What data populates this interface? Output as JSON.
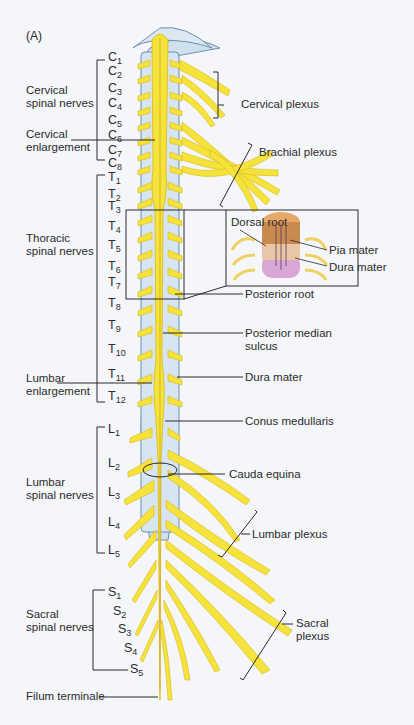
{
  "panel_label": "(A)",
  "colors": {
    "nerve": "#f5e23a",
    "nerve_dark": "#d9b81c",
    "dura": "#cfe0ee",
    "dura_edge": "#6f8fae",
    "line": "#2b2b2b",
    "background": "#f4f6f9",
    "pia": "#d9a26b",
    "dura_inset": "#d9a6d6"
  },
  "segments": {
    "cervical": [
      {
        "letter": "C",
        "num": "1",
        "y": 58
      },
      {
        "letter": "C",
        "num": "2",
        "y": 72
      },
      {
        "letter": "C",
        "num": "3",
        "y": 89
      },
      {
        "letter": "C",
        "num": "4",
        "y": 104
      },
      {
        "letter": "C",
        "num": "5",
        "y": 121
      },
      {
        "letter": "C",
        "num": "6",
        "y": 136
      },
      {
        "letter": "C",
        "num": "7",
        "y": 151
      },
      {
        "letter": "C",
        "num": "8",
        "y": 164
      }
    ],
    "thoracic": [
      {
        "letter": "T",
        "num": "1",
        "y": 178
      },
      {
        "letter": "T",
        "num": "2",
        "y": 195
      },
      {
        "letter": "T",
        "num": "3",
        "y": 207
      },
      {
        "letter": "T",
        "num": "4",
        "y": 227
      },
      {
        "letter": "T",
        "num": "5",
        "y": 246
      },
      {
        "letter": "T",
        "num": "6",
        "y": 267
      },
      {
        "letter": "T",
        "num": "7",
        "y": 283
      },
      {
        "letter": "T",
        "num": "8",
        "y": 304
      },
      {
        "letter": "T",
        "num": "9",
        "y": 326
      },
      {
        "letter": "T",
        "num": "10",
        "y": 350
      },
      {
        "letter": "T",
        "num": "11",
        "y": 375
      },
      {
        "letter": "T",
        "num": "12",
        "y": 397
      }
    ],
    "lumbar": [
      {
        "letter": "L",
        "num": "1",
        "y": 430
      },
      {
        "letter": "L",
        "num": "2",
        "y": 464
      },
      {
        "letter": "L",
        "num": "3",
        "y": 493
      },
      {
        "letter": "L",
        "num": "4",
        "y": 523
      },
      {
        "letter": "L",
        "num": "5",
        "y": 551
      }
    ],
    "sacral": [
      {
        "letter": "S",
        "num": "1",
        "y": 593
      },
      {
        "letter": "S",
        "num": "2",
        "y": 612
      },
      {
        "letter": "S",
        "num": "3",
        "y": 630
      },
      {
        "letter": "S",
        "num": "4",
        "y": 649
      },
      {
        "letter": "S",
        "num": "5",
        "y": 670
      }
    ]
  },
  "left_labels": {
    "cervical_nerves": [
      "Cervical",
      "spinal nerves"
    ],
    "cervical_enlargement": [
      "Cervical",
      "enlargement"
    ],
    "thoracic_nerves": [
      "Thoracic",
      "spinal nerves"
    ],
    "lumbar_enlargement": [
      "Lumbar",
      "enlargement"
    ],
    "lumbar_nerves": [
      "Lumbar",
      "spinal nerves"
    ],
    "sacral_nerves": [
      "Sacral",
      "spinal nerves"
    ],
    "filum_terminale": "Filum terminale"
  },
  "right_labels": {
    "cervical_plexus": "Cervical plexus",
    "brachial_plexus": "Brachial plexus",
    "posterior_root": "Posterior root",
    "posterior_median_sulcus": [
      "Posterior median",
      "sulcus"
    ],
    "dura_mater": "Dura mater",
    "conus_medullaris": "Conus medullaris",
    "cauda_equina": "Cauda equina",
    "lumbar_plexus": "Lumbar plexus",
    "sacral_plexus": [
      "Sacral",
      "plexus"
    ]
  },
  "inset": {
    "dorsal_root": "Dorsal root",
    "pia_mater": "Pia mater",
    "dura_mater": "Dura mater"
  }
}
